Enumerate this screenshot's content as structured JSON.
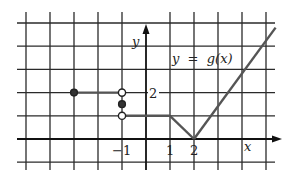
{
  "chart_data": {
    "type": "line",
    "title": "y = g(x)",
    "xlabel": "x",
    "ylabel": "y",
    "xlim": [
      -5.4,
      5.4
    ],
    "ylim": [
      -1.2,
      5.2
    ],
    "grid": true,
    "tick_labels": {
      "x": [
        {
          "value": -1,
          "label": "−1"
        },
        {
          "value": 1,
          "label": "1"
        },
        {
          "value": 2,
          "label": "2"
        }
      ],
      "y": [
        {
          "value": 2,
          "label": "2"
        }
      ]
    },
    "segments": [
      {
        "from": [
          -3,
          2
        ],
        "to": [
          -1,
          2
        ],
        "start": "closed",
        "end": "open"
      },
      {
        "from": [
          -1,
          1
        ],
        "to": [
          1,
          1
        ],
        "start": "open",
        "end": "none"
      },
      {
        "from": [
          1,
          1
        ],
        "to": [
          2,
          0
        ],
        "start": "none",
        "end": "none"
      },
      {
        "from": [
          2,
          0
        ],
        "to": [
          5.4,
          4.8
        ],
        "start": "none",
        "end": "none"
      }
    ],
    "points": [
      {
        "x": -3,
        "y": 2,
        "type": "closed"
      },
      {
        "x": -1,
        "y": 2,
        "type": "open"
      },
      {
        "x": -1,
        "y": 1.5,
        "type": "closed"
      },
      {
        "x": -1,
        "y": 1,
        "type": "open"
      }
    ]
  },
  "labels": {
    "function": "y  =  g(x)",
    "x_axis": "x",
    "y_axis": "y",
    "tick_x_neg1": "−1",
    "tick_x_1": "1",
    "tick_x_2": "2",
    "tick_y_2": "2"
  },
  "colors": {
    "grid": "#2a2a2a",
    "curve": "#555555",
    "axis": "#111111"
  }
}
